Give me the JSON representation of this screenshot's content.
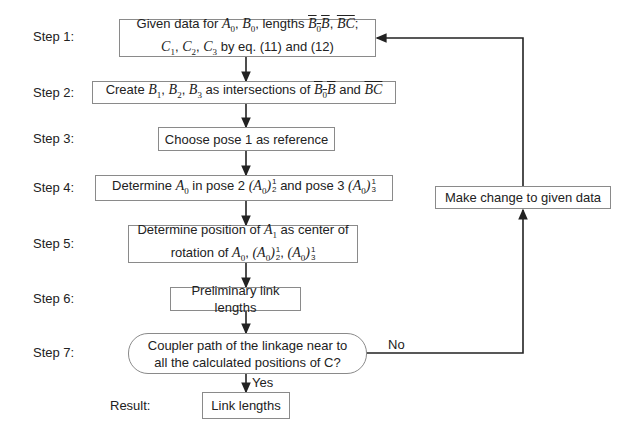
{
  "steps": [
    {
      "label": "Step 1:",
      "text_line1": "Given data for A0, B0, lengths B0B, BC;",
      "text_line2": "C1, C2, C3 by eq. (11) and (12)"
    },
    {
      "label": "Step 2:",
      "text": "Create B1, B2, B3 as intersections of B0B and BC"
    },
    {
      "label": "Step 3:",
      "text": "Choose pose 1 as reference"
    },
    {
      "label": "Step 4:",
      "text": "Determine A0 in pose 2 (A0)^1_2 and pose 3 (A0)^1_3"
    },
    {
      "label": "Step 5:",
      "text_line1": "Determine position of A1 as center of",
      "text_line2": "rotation of A0, (A0)^1_2, (A0)^1_3"
    },
    {
      "label": "Step 6:",
      "text": "Preliminary link lengths"
    },
    {
      "label": "Step 7:",
      "text_line1": "Coupler path of the linkage near to",
      "text_line2": "all the calculated positions of C?"
    }
  ],
  "result": {
    "label": "Result:",
    "text": "Link lengths"
  },
  "feedback": {
    "text": "Make change to given data"
  },
  "edges": {
    "no": "No",
    "yes": "Yes"
  },
  "fragments": {
    "given_data_for": "Given data for ",
    "lengths": ", lengths ",
    "by_eq": " by eq. (11) and (12)",
    "create": "Create ",
    "as_intersections": " as intersections of ",
    "and": " and ",
    "determine": "Determine ",
    "in_pose2": " in pose 2 ",
    "and_pose3": " and pose 3 ",
    "det_pos": "Determine position of ",
    "as_center": " as center of",
    "rotation_of": "rotation of "
  }
}
